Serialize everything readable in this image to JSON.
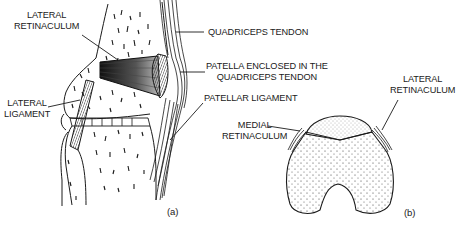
{
  "figure": {
    "panel_a": {
      "id_label": "(a)",
      "labels": {
        "lateral_retinaculum_line1": "LATERAL",
        "lateral_retinaculum_line2": "RETINACULUM",
        "lateral_ligament_line1": "LATERAL",
        "lateral_ligament_line2": "LIGAMENT",
        "quadriceps_tendon": "QUADRICEPS TENDON",
        "patella_enclosed_line1": "PATELLA ENCLOSED IN THE",
        "patella_enclosed_line2": "QUADRICEPS TENDON",
        "patellar_ligament": "PATELLAR LIGAMENT"
      }
    },
    "panel_b": {
      "id_label": "(b)",
      "labels": {
        "lateral_retinaculum_line1": "LATERAL",
        "lateral_retinaculum_line2": "RETINACULUM",
        "medial_retinaculum_line1": "MEDIAL",
        "medial_retinaculum_line2": "RETINACULUM"
      }
    },
    "colors": {
      "ink": "#1a1a1a",
      "background": "#ffffff"
    }
  }
}
